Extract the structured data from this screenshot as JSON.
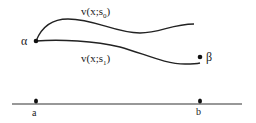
{
  "diagram": {
    "type": "shooting-method-illustration",
    "labels": {
      "alpha": "α",
      "beta": "β",
      "a": "a",
      "b": "b",
      "curve0_prefix": "v(x;s",
      "curve0_sub": "0",
      "curve0_suffix": ")",
      "curve1_prefix": "v(x;s",
      "curve1_sub": "1",
      "curve1_suffix": ")"
    },
    "colors": {
      "ink": "#222222",
      "background": "#ffffff"
    }
  }
}
